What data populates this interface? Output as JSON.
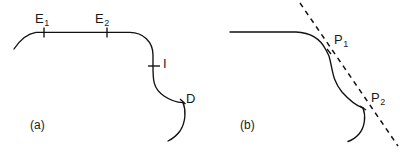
{
  "figure": {
    "background_color": "#ffffff",
    "stroke_color": "#111111",
    "width": 412,
    "height": 152,
    "panels": [
      {
        "id": "a",
        "caption": "(a)",
        "labels": [
          {
            "name": "E1",
            "base": "E",
            "sub": "1"
          },
          {
            "name": "E2",
            "base": "E",
            "sub": "2"
          },
          {
            "name": "I",
            "base": "I",
            "sub": ""
          },
          {
            "name": "D",
            "base": "D",
            "sub": ""
          }
        ],
        "markers": [
          {
            "label": "E1",
            "x": 44,
            "y": 32
          },
          {
            "label": "E2",
            "x": 107,
            "y": 32
          },
          {
            "label": "I",
            "x": 156,
            "y": 66
          },
          {
            "label": "D",
            "x": 183,
            "y": 102
          }
        ],
        "curve_description": "arc rising to horizontal segment, rounded corner down to vertical, then S-curve ending at D with a separate trailing arc"
      },
      {
        "id": "b",
        "caption": "(b)",
        "labels": [
          {
            "name": "P1",
            "base": "P",
            "sub": "1"
          },
          {
            "name": "P2",
            "base": "P",
            "sub": "2"
          }
        ],
        "markers": [
          {
            "label": "P1",
            "x": 330,
            "y": 46
          },
          {
            "label": "P2",
            "x": 363,
            "y": 108
          }
        ],
        "tangent_line": {
          "style": "dashed",
          "x1": 300,
          "y1": 3,
          "x2": 398,
          "y2": 146
        },
        "curve_description": "horizontal line bending down into an S-curve through P1 and P2 with a trailing arc, cut by a dashed secant line"
      }
    ]
  }
}
